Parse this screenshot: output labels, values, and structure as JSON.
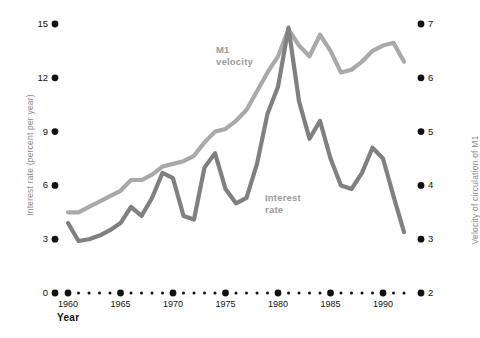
{
  "chart_data": {
    "type": "line",
    "title": "",
    "xlabel": "Year",
    "ylabel": "Interest rate (percent per year)",
    "y2label": "Velocity of circulation of M1",
    "xlim": [
      1960,
      1992
    ],
    "ylim": [
      0,
      15
    ],
    "y2lim": [
      2,
      7
    ],
    "grid": false,
    "legend_position": "inline-annotations",
    "xticks_major": [
      1960,
      1965,
      1970,
      1975,
      1980,
      1985,
      1990
    ],
    "xtick_labels": [
      "1960",
      "1965",
      "1970",
      "1975",
      "1980",
      "1985",
      "1990"
    ],
    "xticks_minor_step": 1,
    "yticks_left": [
      0,
      3,
      6,
      9,
      12,
      15
    ],
    "ytick_labels_left": [
      "0",
      "3",
      "6",
      "9",
      "12",
      "15"
    ],
    "yticks_right": [
      2,
      3,
      4,
      5,
      6,
      7
    ],
    "ytick_labels_right": [
      "2",
      "3",
      "4",
      "5",
      "6",
      "7"
    ],
    "annotations": [
      {
        "name": "m1-velocity",
        "text": "M1\nvelocity",
        "x": 1974.5,
        "y": 13.3
      },
      {
        "name": "interest-rate",
        "text": "Interest\nrate",
        "x": 1978.0,
        "y": 5.6
      }
    ],
    "series": [
      {
        "name": "M1 velocity",
        "axis": "right",
        "color": "#a9a9a9",
        "x": [
          1960,
          1961,
          1962,
          1963,
          1964,
          1965,
          1966,
          1967,
          1968,
          1969,
          1970,
          1971,
          1972,
          1973,
          1974,
          1975,
          1976,
          1977,
          1978,
          1979,
          1980,
          1981,
          1982,
          1983,
          1984,
          1985,
          1986,
          1987,
          1988,
          1989,
          1990,
          1991,
          1992
        ],
        "values": [
          3.5,
          3.5,
          3.6,
          3.7,
          3.8,
          3.9,
          4.1,
          4.1,
          4.2,
          4.35,
          4.4,
          4.45,
          4.55,
          4.8,
          5.0,
          5.05,
          5.2,
          5.4,
          5.75,
          6.1,
          6.4,
          6.9,
          6.6,
          6.4,
          6.8,
          6.5,
          6.1,
          6.15,
          6.3,
          6.5,
          6.6,
          6.65,
          6.3
        ]
      },
      {
        "name": "Interest rate",
        "axis": "left",
        "color": "#808080",
        "x": [
          1960,
          1961,
          1962,
          1963,
          1964,
          1965,
          1966,
          1967,
          1968,
          1969,
          1970,
          1971,
          1972,
          1973,
          1974,
          1975,
          1976,
          1977,
          1978,
          1979,
          1980,
          1981,
          1982,
          1983,
          1984,
          1985,
          1986,
          1987,
          1988,
          1989,
          1990,
          1991,
          1992
        ],
        "values": [
          3.9,
          2.9,
          3.0,
          3.2,
          3.5,
          3.9,
          4.8,
          4.3,
          5.3,
          6.7,
          6.4,
          4.3,
          4.1,
          7.0,
          7.8,
          5.8,
          5.0,
          5.3,
          7.2,
          10.0,
          11.5,
          14.8,
          10.7,
          8.6,
          9.6,
          7.5,
          6.0,
          5.8,
          6.7,
          8.1,
          7.5,
          5.4,
          3.4
        ]
      }
    ]
  },
  "axes": {
    "left_title": "Interest rate (percent per year)",
    "right_title": "Velocity of circulation of M1",
    "x_title": "Year"
  },
  "colors": {
    "m1_velocity": "#a9a9a9",
    "interest_rate": "#808080",
    "tick_dot": "#111111",
    "axis_text": "#8d8d8d",
    "background": "#ffffff"
  }
}
